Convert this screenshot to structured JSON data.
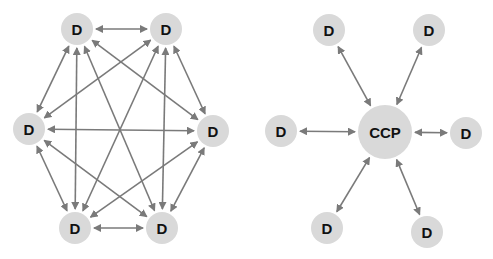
{
  "colors": {
    "node_fill": "#d9d9d9",
    "arrow": "#7a7a7a",
    "text": "#111111"
  },
  "mesh": {
    "title": "",
    "nodes": [
      {
        "id": "tl",
        "label": "D",
        "x": 77,
        "y": 29
      },
      {
        "id": "tr",
        "label": "D",
        "x": 166,
        "y": 29
      },
      {
        "id": "l",
        "label": "D",
        "x": 29,
        "y": 129
      },
      {
        "id": "r",
        "label": "D",
        "x": 213,
        "y": 131
      },
      {
        "id": "bl",
        "label": "D",
        "x": 75,
        "y": 228
      },
      {
        "id": "br",
        "label": "D",
        "x": 162,
        "y": 228
      }
    ],
    "edges": [
      [
        "tl",
        "tr"
      ],
      [
        "tl",
        "l"
      ],
      [
        "tl",
        "r"
      ],
      [
        "tl",
        "bl"
      ],
      [
        "tl",
        "br"
      ],
      [
        "tr",
        "l"
      ],
      [
        "tr",
        "r"
      ],
      [
        "tr",
        "bl"
      ],
      [
        "tr",
        "br"
      ],
      [
        "l",
        "r"
      ],
      [
        "l",
        "bl"
      ],
      [
        "l",
        "br"
      ],
      [
        "r",
        "bl"
      ],
      [
        "r",
        "br"
      ],
      [
        "bl",
        "br"
      ]
    ]
  },
  "hub": {
    "center": {
      "id": "ccp",
      "label": "CCP",
      "x": 385,
      "y": 132
    },
    "nodes": [
      {
        "id": "h1",
        "label": "D",
        "x": 329,
        "y": 30
      },
      {
        "id": "h2",
        "label": "D",
        "x": 429,
        "y": 30
      },
      {
        "id": "h3",
        "label": "D",
        "x": 281,
        "y": 131
      },
      {
        "id": "h4",
        "label": "D",
        "x": 466,
        "y": 133
      },
      {
        "id": "h5",
        "label": "D",
        "x": 327,
        "y": 228
      },
      {
        "id": "h6",
        "label": "D",
        "x": 427,
        "y": 232
      }
    ]
  }
}
